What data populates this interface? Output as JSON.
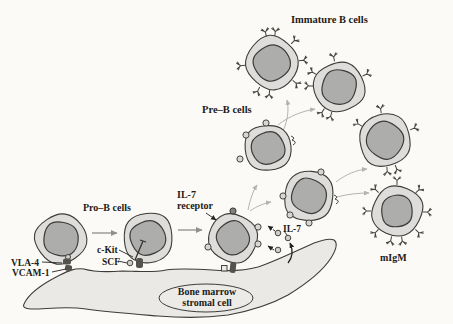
{
  "labels": {
    "immature_b_cells": "Immature B cells",
    "pre_b_cells": "Pre–B cells",
    "pro_b_cells": "Pro–B cells",
    "il7_receptor_line1": "IL-7",
    "il7_receptor_line2": "receptor",
    "il7_cytokine": "IL-7",
    "c_kit": "c-Kit",
    "scf": "SCF",
    "vla4": "VLA-4",
    "vcam1": "VCAM-1",
    "migm": "mIgM",
    "stromal_cell_line1": "Bone marrow",
    "stromal_cell_line2": "stromal cell"
  },
  "colors": {
    "background": "#fbfaf6",
    "cell_cytoplasm": "#dedddb",
    "cell_nucleus": "#adadab",
    "stromal_fill": "#eae9e6",
    "outline": "#3c3c38",
    "transition_arrow": "#8f8f8d",
    "maturation_arrow": "#b3b3b1",
    "text": "#1c1c1a"
  }
}
